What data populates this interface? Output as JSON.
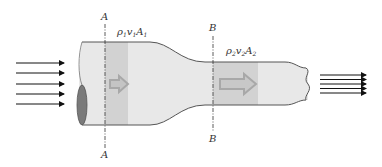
{
  "diagram": {
    "sections": [
      {
        "id": "A",
        "label_top": "A",
        "label_bottom": "A",
        "quantity": {
          "rho": "ρ",
          "rho_sub": "1",
          "v": "v",
          "v_sub": "1",
          "A": "A",
          "A_sub": "1"
        }
      },
      {
        "id": "B",
        "label_top": "B",
        "label_bottom": "B",
        "quantity": {
          "rho": "ρ",
          "rho_sub": "2",
          "v": "v",
          "v_sub": "2",
          "A": "A",
          "A_sub": "2"
        }
      }
    ],
    "inflow_arrows": 5,
    "outflow_arrows": 5,
    "colors": {
      "pipe_fill": "#e8e8e8",
      "pipe_outline": "#555555",
      "shaded_volume": "#cfcfcf",
      "flow_arrow": "#a8a8a8",
      "end_cap": "#7a7a7a",
      "stream_arrows": "#111111"
    }
  }
}
